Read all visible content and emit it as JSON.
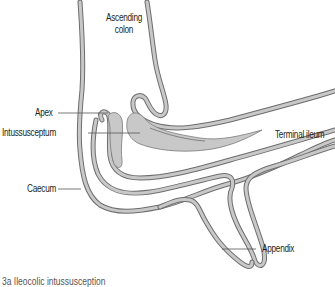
{
  "figure": {
    "colors": {
      "wall_fill": "#c8c8c8",
      "wall_stroke": "#6d6d6d",
      "leader_line": "#555555",
      "text": "#231f20",
      "background": "#ffffff"
    },
    "labels": {
      "ascending_colon_line1": "Ascending",
      "ascending_colon_line2": "colon",
      "apex": "Apex",
      "intussusceptum": "Intussusceptum",
      "terminal_ileum": "Terminal ileum",
      "caecum": "Caecum",
      "appendix": "Appendix"
    },
    "caption": "3a  Ileocolic intussusception"
  }
}
